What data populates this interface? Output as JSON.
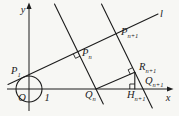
{
  "figure": {
    "type": "geometry-diagram",
    "colors": {
      "stroke": "#1c1c1c",
      "background": "#f7f7f4"
    },
    "axes": {
      "x_label": "x",
      "y_label": "y",
      "origin_label": "O",
      "unit_tick_label": "1"
    },
    "line_label": "l",
    "points": {
      "p1": {
        "base": "P",
        "sub": "1"
      },
      "pn": {
        "base": "P",
        "sub": "n"
      },
      "pn_plus_1": {
        "base": "P",
        "sub": "n+1"
      },
      "qn": {
        "base": "Q",
        "sub": "n"
      },
      "qn_plus_1": {
        "base": "Q",
        "sub": "n+1"
      },
      "rn_plus_1": {
        "base": "R",
        "sub": "n+1"
      },
      "hn_plus_1": {
        "base": "H",
        "sub": "n+1"
      }
    }
  }
}
